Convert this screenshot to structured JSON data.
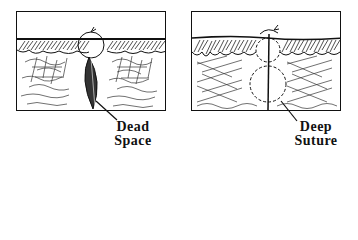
{
  "figure": {
    "panels": [
      {
        "id": "left",
        "label_line1": "Dead",
        "label_line2": "Space",
        "callout": "dead-space-pocket"
      },
      {
        "id": "right",
        "label_line1": "Deep",
        "label_line2": "Suture",
        "callout": "deep-suture-loop"
      }
    ]
  }
}
